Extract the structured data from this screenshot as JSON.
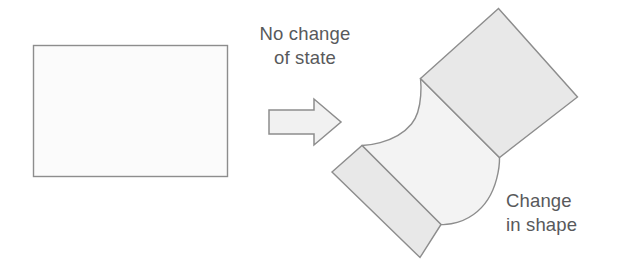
{
  "figure": {
    "captions": {
      "transition_label": "No change\nof state",
      "result_label": "Change\nin shape"
    },
    "colors": {
      "outline": "#8c8c8c",
      "panel_fill": "#e8e8e8",
      "band_fill": "#f3f3f3",
      "rect_fill": "#fbfbfb",
      "arrow_fill": "#f0f0f0",
      "text": "#58595b",
      "background": "#ffffff"
    },
    "shapes": [
      {
        "name": "undeformed-rectangle",
        "kind": "rectangle",
        "x": 33,
        "y": 45,
        "width": 195,
        "height": 132
      },
      {
        "name": "transition-arrow",
        "kind": "block-arrow",
        "direction": "right",
        "x": 268,
        "y": 98,
        "width": 72,
        "height": 48
      },
      {
        "name": "deformed-shape",
        "kind": "sheared-curved-body",
        "rotation_deg": 45,
        "panels": 2,
        "curves": [
          "concave-upper-left",
          "convex-lower-right"
        ]
      }
    ]
  }
}
